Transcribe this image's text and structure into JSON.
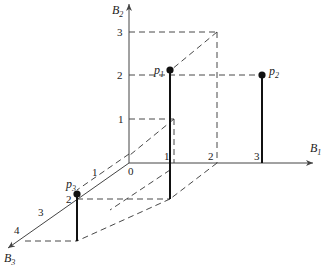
{
  "diagram": {
    "type": "3d-coordinate-system",
    "axes": {
      "x": {
        "name": "B",
        "sub": "1",
        "ticks": [
          "1",
          "2",
          "3"
        ]
      },
      "y": {
        "name": "B",
        "sub": "2",
        "ticks": [
          "1",
          "2",
          "3"
        ]
      },
      "z": {
        "name": "B",
        "sub": "3",
        "ticks": [
          "1",
          "2",
          "3",
          "4"
        ]
      },
      "origin_label": "0"
    },
    "points": [
      {
        "name": "p",
        "sub": "1",
        "coords": [
          1,
          2,
          1
        ]
      },
      {
        "name": "p",
        "sub": "2",
        "coords": [
          3,
          2,
          0
        ]
      },
      {
        "name": "p",
        "sub": "3",
        "coords": [
          0,
          1,
          2
        ]
      }
    ],
    "colors": {
      "ink": "#222222",
      "background": "#ffffff"
    }
  }
}
